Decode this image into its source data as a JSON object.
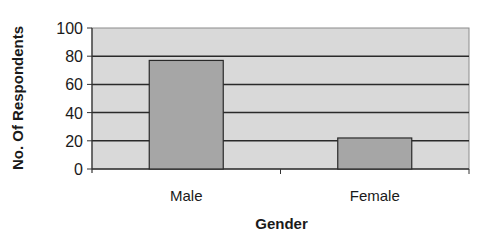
{
  "chart_data": {
    "type": "bar",
    "title": "",
    "xlabel": "Gender",
    "ylabel": "No. Of Respondents",
    "categories": [
      "Male",
      "Female"
    ],
    "values": [
      77,
      22
    ],
    "ylim": [
      0,
      100
    ],
    "yticks": [
      0,
      20,
      40,
      60,
      80,
      100
    ],
    "grid": true,
    "legend": null,
    "colors": {
      "plot_bg": "#d9d9d9",
      "bar": "#a6a6a6",
      "bar_border": "#2a2a2a",
      "gridline": "#2a2a2a"
    }
  }
}
